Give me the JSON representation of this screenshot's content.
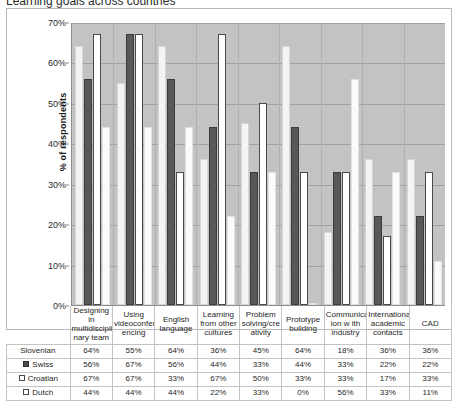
{
  "title": "Learning goals across countries",
  "chart_data": {
    "type": "bar",
    "title": "Learning goals across countries",
    "xlabel": "",
    "ylabel": "% of respondents",
    "ylim": [
      0,
      70
    ],
    "ytick_labels": [
      "70%",
      "60%",
      "50%",
      "40%",
      "30%",
      "20%",
      "10%",
      "0%"
    ],
    "ytick_values": [
      70,
      60,
      50,
      40,
      30,
      20,
      10,
      0
    ],
    "grid": true,
    "legend_position": "table-row-headers",
    "categories": [
      "Designing in multidiscipli nary team",
      "Using videoconfer encing",
      "English language",
      "Learning from other cultures",
      "Problem solving/cre ativity",
      "Prototype building",
      "Communicat ion w ith industry",
      "International academic contacts",
      "CAD"
    ],
    "series": [
      {
        "name": "Slovenian",
        "marker": "none",
        "color": "#f4f4f4",
        "values": [
          64,
          55,
          64,
          36,
          45,
          64,
          18,
          36,
          36
        ],
        "labels": [
          "64%",
          "55%",
          "64%",
          "36%",
          "45%",
          "64%",
          "18%",
          "36%",
          "36%"
        ]
      },
      {
        "name": "Swiss",
        "marker": "filled",
        "color": "#585858",
        "values": [
          56,
          67,
          56,
          44,
          33,
          44,
          33,
          22,
          22
        ],
        "labels": [
          "56%",
          "67%",
          "56%",
          "44%",
          "33%",
          "44%",
          "33%",
          "22%",
          "22%"
        ]
      },
      {
        "name": "Croatian",
        "marker": "outline",
        "color": "#ffffff",
        "values": [
          67,
          67,
          33,
          67,
          50,
          33,
          33,
          17,
          33
        ],
        "labels": [
          "67%",
          "67%",
          "33%",
          "67%",
          "50%",
          "33%",
          "33%",
          "17%",
          "33%"
        ]
      },
      {
        "name": "Dutch",
        "marker": "outline",
        "color": "#fbfbfb",
        "values": [
          44,
          44,
          44,
          22,
          33,
          0,
          56,
          33,
          11
        ],
        "labels": [
          "44%",
          "44%",
          "44%",
          "22%",
          "33%",
          "0%",
          "56%",
          "33%",
          "11%"
        ]
      }
    ]
  },
  "colors": {
    "plot_background": "#c3c3c3",
    "gridline": "#a2a2a2",
    "axis": "#8d8d8d",
    "table_border": "#c4c4c4",
    "text": "#1f1f1f"
  }
}
